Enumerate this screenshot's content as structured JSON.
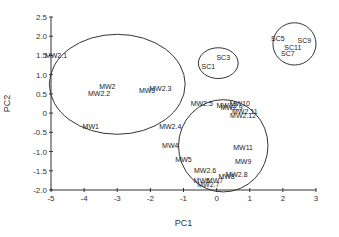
{
  "chart_data": {
    "type": "scatter",
    "title": "",
    "xlabel": "PC1",
    "ylabel": "PC2",
    "xlim": [
      -5,
      3
    ],
    "ylim": [
      -2.0,
      2.5
    ],
    "xticks": [
      "-5",
      "-4",
      "-3",
      "-2",
      "-1",
      "0",
      "1",
      "2",
      "3"
    ],
    "xtick_values": [
      -5,
      -4,
      -3,
      -2,
      -1,
      0,
      1,
      2,
      3
    ],
    "yticks": [
      "-2.0",
      "-1.5",
      "-1.0",
      "-0.5",
      "0",
      "0.5",
      "1.0",
      "1.5",
      "2.0",
      "2.5"
    ],
    "ytick_values": [
      -2.0,
      -1.5,
      -1.0,
      -0.5,
      0,
      0.5,
      1.0,
      1.5,
      2.0,
      2.5
    ],
    "grid": false,
    "points": [
      {
        "label": "MW2.1",
        "x": -4.85,
        "y": 1.5
      },
      {
        "label": "MW2",
        "x": -3.3,
        "y": 0.7
      },
      {
        "label": "MW2.2",
        "x": -3.55,
        "y": 0.5
      },
      {
        "label": "MW3",
        "x": -2.1,
        "y": 0.6
      },
      {
        "label": "MW2.3",
        "x": -1.7,
        "y": 0.65
      },
      {
        "label": "MW1",
        "x": -3.8,
        "y": -0.35
      },
      {
        "label": "SC3",
        "x": 0.2,
        "y": 1.45
      },
      {
        "label": "SC1",
        "x": -0.25,
        "y": 1.2
      },
      {
        "label": "SC5",
        "x": 1.85,
        "y": 1.95
      },
      {
        "label": "SC9",
        "x": 2.65,
        "y": 1.9
      },
      {
        "label": "SC11",
        "x": 2.3,
        "y": 1.7
      },
      {
        "label": "SC7",
        "x": 2.15,
        "y": 1.55
      },
      {
        "label": "MW2.5",
        "x": -0.45,
        "y": 0.25
      },
      {
        "label": "MW10",
        "x": 0.7,
        "y": 0.25
      },
      {
        "label": "MW12",
        "x": 0.3,
        "y": 0.2
      },
      {
        "label": "MW2.9",
        "x": 0.45,
        "y": 0.15
      },
      {
        "label": "MW2.11",
        "x": 0.85,
        "y": 0.05
      },
      {
        "label": "MW2.12",
        "x": 0.8,
        "y": -0.05
      },
      {
        "label": "MW2.4",
        "x": -1.4,
        "y": -0.35
      },
      {
        "label": "MW4",
        "x": -1.4,
        "y": -0.85
      },
      {
        "label": "MW11",
        "x": 0.8,
        "y": -0.9
      },
      {
        "label": "MW5",
        "x": -1.0,
        "y": -1.2
      },
      {
        "label": "MW9",
        "x": 0.8,
        "y": -1.25
      },
      {
        "label": "MW2.6",
        "x": -0.35,
        "y": -1.5
      },
      {
        "label": "MW2.8",
        "x": 0.6,
        "y": -1.6
      },
      {
        "label": "MW8",
        "x": 0.3,
        "y": -1.65
      },
      {
        "label": "MW6",
        "x": -0.45,
        "y": -1.75
      },
      {
        "label": "MW7",
        "x": -0.05,
        "y": -1.75
      },
      {
        "label": "MW2.7",
        "x": -0.25,
        "y": -1.85
      }
    ],
    "ellipses": [
      {
        "name": "left-cluster",
        "cx": -3.0,
        "cy": 0.75,
        "rx": 2.05,
        "ry": 1.3
      },
      {
        "name": "sc-small-cluster",
        "cx": 0.05,
        "cy": 1.3,
        "rx": 0.6,
        "ry": 0.4
      },
      {
        "name": "sc-right-cluster",
        "cx": 2.35,
        "cy": 1.8,
        "rx": 0.65,
        "ry": 0.55
      },
      {
        "name": "mw-lower-cluster",
        "cx": 0.2,
        "cy": -0.85,
        "rx": 1.35,
        "ry": 1.2
      }
    ]
  }
}
